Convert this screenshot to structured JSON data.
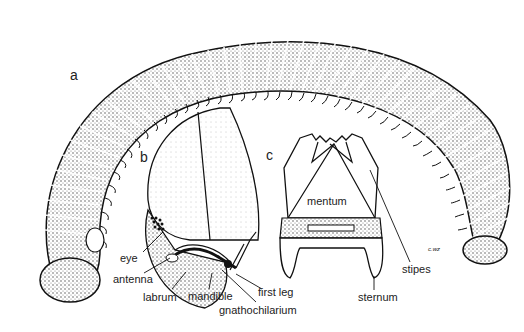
{
  "figure": {
    "panels": [
      {
        "id": "a",
        "label": "a"
      },
      {
        "id": "b",
        "label": "b"
      },
      {
        "id": "c",
        "label": "c"
      }
    ],
    "labels_b": {
      "eye": "eye",
      "antenna": "antenna",
      "labrum": "labrum",
      "mandible": "mandible",
      "gnathochilarium": "gnathochilarium",
      "first_leg": "first leg"
    },
    "labels_c": {
      "mentum": "mentum",
      "stipes": "stipes",
      "sternum": "sternum"
    },
    "signature": "c.wz"
  },
  "colors": {
    "ink": "#222222",
    "paper": "#ffffff",
    "stipple": "#6a6a6a"
  }
}
